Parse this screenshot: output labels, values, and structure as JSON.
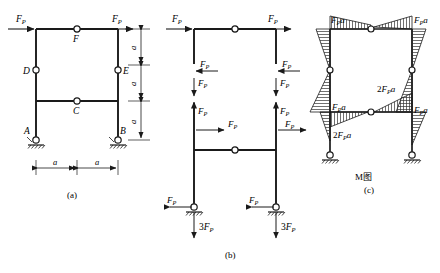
{
  "figure": {
    "background_color": "#ffffff",
    "line_color": "#1a1a1a",
    "hatch_color": "#333333"
  },
  "panels": [
    {
      "id": "a",
      "caption": "(a)",
      "description": "Frame geometry with applied loads, internal hinges and pin supports",
      "node_labels": [
        "A",
        "B",
        "C",
        "D",
        "E",
        "F"
      ],
      "load_labels": [
        "F_P",
        "F_P"
      ],
      "horizontal_dimensions": [
        "a",
        "a"
      ],
      "vertical_dimensions": [
        "a",
        "a",
        "a"
      ],
      "supports": [
        "pin",
        "pin"
      ]
    },
    {
      "id": "b",
      "caption": "(b)",
      "description": "Separated free-body diagrams with internal forces and support reactions",
      "applied_loads": [
        "F_P",
        "F_P"
      ],
      "internal_forces": [
        "F_P",
        "F_P",
        "F_P",
        "F_P",
        "F_P",
        "F_P",
        "F_P",
        "F_P"
      ],
      "reaction_horizontal": [
        "F_P",
        "F_P"
      ],
      "reaction_vertical": [
        "3F_P",
        "3F_P"
      ]
    },
    {
      "id": "c",
      "caption": "(c)",
      "diagram_name": "M图",
      "description": "Bending moment diagram with hatched ordinates",
      "moment_labels": [
        "F_Pa",
        "F_Pa",
        "F_Pa",
        "F_Pa",
        "2F_Pa",
        "2F_Pa"
      ]
    }
  ],
  "text": {
    "FP": "F",
    "FP_sub": "P",
    "three_FP": "3F",
    "FPa": "F",
    "FPa_sub": "P",
    "FPa_tail": "a",
    "two": "2",
    "three": "3",
    "a": "a",
    "A": "A",
    "B": "B",
    "C": "C",
    "D": "D",
    "E": "E",
    "F": "F",
    "M_diagram": "M图",
    "cap_a": "(a)",
    "cap_b": "(b)",
    "cap_c": "(c)"
  }
}
